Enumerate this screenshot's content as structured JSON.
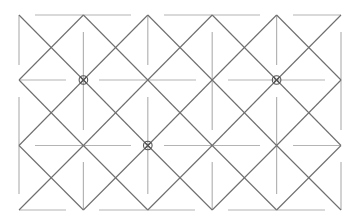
{
  "diagram": {
    "type": "diamond-lattice",
    "colors": {
      "background": "#ffffff",
      "diagonal_lines": "#6e6e6e",
      "guide_lines": "#b4b4b4",
      "markers": "#555555"
    },
    "grid": {
      "columns_x": [
        19,
        83.4,
        147.8,
        212.2,
        276.6,
        341
      ],
      "rows_y": [
        15,
        80,
        145.5,
        210
      ]
    },
    "horizontal_guides": [
      {
        "y": 15,
        "segments": [
          [
            35,
            131
          ],
          [
            164,
            260
          ],
          [
            293,
            341
          ]
        ]
      },
      {
        "y": 80,
        "segments": [
          [
            19,
            66
          ],
          [
            99,
            196
          ],
          [
            228,
            325
          ]
        ]
      },
      {
        "y": 145.5,
        "segments": [
          [
            35,
            131
          ],
          [
            164,
            260
          ],
          [
            293,
            341
          ]
        ]
      },
      {
        "y": 210,
        "segments": [
          [
            19,
            66
          ],
          [
            99,
            195
          ],
          [
            228,
            325
          ]
        ]
      }
    ],
    "vertical_guides": [
      {
        "x": 19,
        "segments": [
          [
            15,
            65
          ],
          [
            97,
            194
          ]
        ]
      },
      {
        "x": 83.4,
        "segments": [
          [
            32,
            130
          ],
          [
            162,
            210
          ]
        ]
      },
      {
        "x": 147.8,
        "segments": [
          [
            15,
            65
          ],
          [
            97,
            194
          ]
        ]
      },
      {
        "x": 212.2,
        "segments": [
          [
            32,
            130
          ],
          [
            162,
            210
          ]
        ]
      },
      {
        "x": 276.6,
        "segments": [
          [
            15,
            65
          ],
          [
            97,
            194
          ]
        ]
      },
      {
        "x": 341,
        "segments": [
          [
            32,
            130
          ],
          [
            162,
            210
          ]
        ]
      }
    ],
    "circled_nodes": [
      {
        "x": 83.4,
        "y": 80,
        "label": "node-1"
      },
      {
        "x": 276.6,
        "y": 80,
        "label": "node-2"
      },
      {
        "x": 147.8,
        "y": 145.5,
        "label": "node-3"
      }
    ]
  }
}
